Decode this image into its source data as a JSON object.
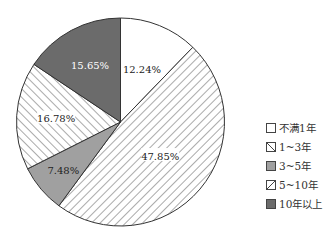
{
  "chart_data": {
    "type": "pie",
    "title": "",
    "start_angle_deg": 0,
    "direction": "clockwise",
    "categories": [
      "不满1年",
      "1~3年",
      "3~5年",
      "5~10年",
      "10年以上"
    ],
    "values": [
      12.24,
      47.85,
      7.48,
      16.78,
      15.65
    ],
    "labels": [
      "12.24%",
      "47.85%",
      "7.48%",
      "16.78%",
      "15.65%"
    ],
    "fills": [
      {
        "type": "solid",
        "color": "#ffffff"
      },
      {
        "type": "hatch-back",
        "color": "#555555"
      },
      {
        "type": "solid",
        "color": "#a0a0a0"
      },
      {
        "type": "hatch-forward",
        "color": "#555555"
      },
      {
        "type": "solid",
        "color": "#6b6b6b"
      }
    ],
    "label_colors": [
      "#222222",
      "#222222",
      "#222222",
      "#222222",
      "#ffffff"
    ],
    "legend_position": "right",
    "geometry": {
      "cx": 120.5,
      "cy": 122,
      "r": 104
    }
  },
  "legend": {
    "items": [
      {
        "label": "不满1年"
      },
      {
        "label": "1~3年"
      },
      {
        "label": "3~5年"
      },
      {
        "label": "5~10年"
      },
      {
        "label": "10年以上"
      }
    ]
  }
}
